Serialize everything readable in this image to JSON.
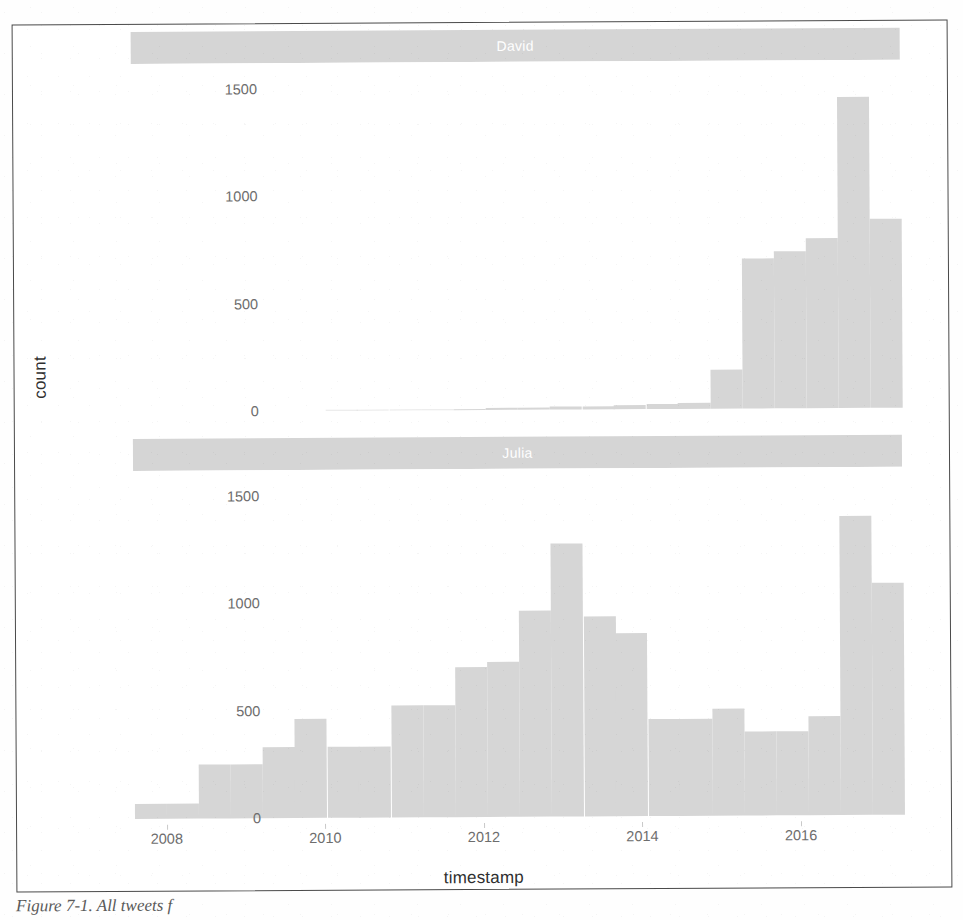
{
  "figure": {
    "caption": "Figure 7-1. All tweets f",
    "y_axis_title": "count",
    "x_axis_title": "timestamp"
  },
  "chart_data": {
    "type": "bar",
    "title": "",
    "subtitle": "",
    "xlabel": "timestamp",
    "ylabel": "count",
    "xlim": [
      2007.6,
      2017.3
    ],
    "ylim": [
      0,
      1620
    ],
    "grid": false,
    "legend_position": "none",
    "facet_variable": "person",
    "facet_labels": [
      "David",
      "Julia"
    ],
    "x_ticks": [
      2008,
      2010,
      2012,
      2014,
      2016
    ],
    "x_tick_labels": [
      "2008",
      "2010",
      "2012",
      "2014",
      "2016"
    ],
    "y_ticks": [
      0,
      500,
      1000,
      1500
    ],
    "y_tick_labels": [
      "0",
      "500",
      "1000",
      "1500"
    ],
    "bin_width": 0.405,
    "bin_starts": [
      2007.6,
      2008.0,
      2008.41,
      2008.81,
      2009.22,
      2009.62,
      2010.03,
      2010.43,
      2010.84,
      2011.24,
      2011.65,
      2012.05,
      2012.46,
      2012.86,
      2013.27,
      2013.67,
      2014.08,
      2014.48,
      2014.89,
      2015.29,
      2015.7,
      2016.1,
      2016.51,
      2016.91
    ],
    "series": [
      {
        "name": "David",
        "values": [
          0,
          0,
          0,
          0,
          0,
          0,
          2,
          3,
          4,
          5,
          6,
          8,
          10,
          12,
          15,
          18,
          22,
          30,
          180,
          700,
          730,
          790,
          1450,
          880
        ]
      },
      {
        "name": "Julia",
        "values": [
          70,
          70,
          250,
          250,
          330,
          460,
          330,
          330,
          520,
          520,
          700,
          720,
          960,
          1270,
          930,
          850,
          450,
          450,
          500,
          390,
          390,
          460,
          1390,
          1080
        ]
      }
    ],
    "colors": {
      "bar_fill": "#d6d6d6",
      "strip_fill": "#d5d5d5",
      "strip_text": "#ffffff",
      "tick_text": "#6d6d6d",
      "axis_title_text": "#2f2f2f",
      "panel_background": "#ffffff",
      "figure_border": "#4a4a4a"
    }
  }
}
